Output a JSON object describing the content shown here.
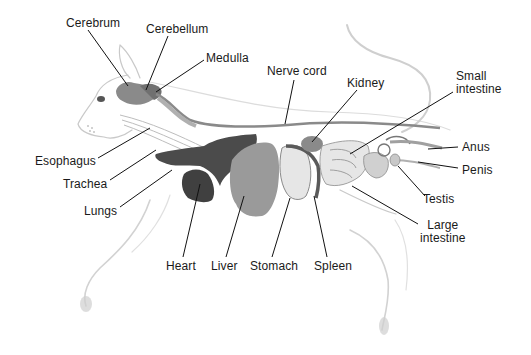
{
  "diagram": {
    "view": "lateral (left side)",
    "colors": {
      "background": "#ffffff",
      "label_text": "#1a1a1a",
      "leader_line": "#111111",
      "outline": "#c8c8c8",
      "organ_dark": "#4a4a4a",
      "organ_mid": "#7a7a7a",
      "organ_light": "#d8d8d8"
    },
    "labels": [
      {
        "id": "cerebrum",
        "text": "Cerebrum",
        "x": 66,
        "y": 17
      },
      {
        "id": "cerebellum",
        "text": "Cerebellum",
        "x": 146,
        "y": 23
      },
      {
        "id": "medulla",
        "text": "Medulla",
        "x": 206,
        "y": 52
      },
      {
        "id": "nerve-cord",
        "text": "Nerve cord",
        "x": 267,
        "y": 65
      },
      {
        "id": "kidney",
        "text": "Kidney",
        "x": 347,
        "y": 77
      },
      {
        "id": "small-intestine",
        "text": "Small intestine",
        "line1": "Small",
        "line2": "intestine",
        "x": 456,
        "y": 70
      },
      {
        "id": "anus",
        "text": "Anus",
        "x": 462,
        "y": 141
      },
      {
        "id": "penis",
        "text": "Penis",
        "x": 462,
        "y": 164
      },
      {
        "id": "testis",
        "text": "Testis",
        "x": 423,
        "y": 193
      },
      {
        "id": "large-intestine",
        "text": "Large intestine",
        "line1": "Large",
        "line2": "intestine",
        "x": 420,
        "y": 219
      },
      {
        "id": "esophagus",
        "text": "Esophagus",
        "x": 35,
        "y": 155
      },
      {
        "id": "trachea",
        "text": "Trachea",
        "x": 63,
        "y": 178
      },
      {
        "id": "lungs",
        "text": "Lungs",
        "x": 84,
        "y": 205
      },
      {
        "id": "heart",
        "text": "Heart",
        "x": 166,
        "y": 260
      },
      {
        "id": "liver",
        "text": "Liver",
        "x": 211,
        "y": 260
      },
      {
        "id": "stomach",
        "text": "Stomach",
        "x": 250,
        "y": 260
      },
      {
        "id": "spleen",
        "text": "Spleen",
        "x": 314,
        "y": 260
      }
    ]
  }
}
